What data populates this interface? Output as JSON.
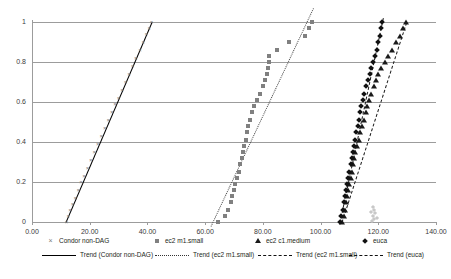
{
  "chart_data": {
    "type": "scatter",
    "title": "",
    "xlabel": "",
    "ylabel": "",
    "xlim": [
      0,
      140
    ],
    "ylim": [
      0,
      1
    ],
    "xticks": [
      "0.00",
      "20.00",
      "40.00",
      "60.00",
      "80.00",
      "100.00",
      "120.00",
      "140.00"
    ],
    "xtick_values": [
      0,
      20,
      40,
      60,
      80,
      100,
      120,
      140
    ],
    "yticks": [
      "0",
      "0.2",
      "0.4",
      "0.6",
      "0.8",
      "1"
    ],
    "ytick_values": [
      0,
      0.2,
      0.4,
      0.6,
      0.8,
      1
    ],
    "grid": "horizontal",
    "legend_position": "bottom",
    "series": [
      {
        "name": "Condor non-DAG",
        "marker": "x",
        "color": "#7a7a7a",
        "points": [
          [
            12.0,
            0.0
          ],
          [
            12.6,
            0.03
          ],
          [
            13.2,
            0.06
          ],
          [
            14.0,
            0.09
          ],
          [
            15.0,
            0.12
          ],
          [
            16.0,
            0.16
          ],
          [
            17.0,
            0.2
          ],
          [
            18.0,
            0.23
          ],
          [
            19.2,
            0.27
          ],
          [
            20.4,
            0.31
          ],
          [
            21.6,
            0.35
          ],
          [
            22.8,
            0.39
          ],
          [
            24.0,
            0.43
          ],
          [
            25.2,
            0.47
          ],
          [
            26.4,
            0.51
          ],
          [
            27.6,
            0.55
          ],
          [
            28.8,
            0.59
          ],
          [
            30.0,
            0.62
          ],
          [
            31.2,
            0.66
          ],
          [
            32.4,
            0.7
          ],
          [
            33.6,
            0.74
          ],
          [
            34.8,
            0.78
          ],
          [
            36.0,
            0.82
          ],
          [
            37.4,
            0.86
          ],
          [
            38.6,
            0.9
          ],
          [
            39.6,
            0.94
          ],
          [
            40.6,
            0.97
          ],
          [
            41.4,
            1.0
          ]
        ]
      },
      {
        "name": "ec2 m1.small",
        "marker": "square",
        "color": "#808080",
        "points": [
          [
            64.5,
            0.0
          ],
          [
            67.0,
            0.03
          ],
          [
            68.0,
            0.06
          ],
          [
            68.8,
            0.1
          ],
          [
            69.4,
            0.13
          ],
          [
            70.0,
            0.16
          ],
          [
            70.5,
            0.19
          ],
          [
            71.0,
            0.22
          ],
          [
            71.6,
            0.25
          ],
          [
            72.2,
            0.29
          ],
          [
            72.6,
            0.32
          ],
          [
            73.0,
            0.35
          ],
          [
            73.5,
            0.38
          ],
          [
            74.0,
            0.41
          ],
          [
            74.5,
            0.45
          ],
          [
            75.0,
            0.48
          ],
          [
            75.6,
            0.51
          ],
          [
            76.2,
            0.55
          ],
          [
            77.0,
            0.58
          ],
          [
            78.0,
            0.61
          ],
          [
            79.0,
            0.64
          ],
          [
            80.0,
            0.68
          ],
          [
            80.8,
            0.71
          ],
          [
            81.5,
            0.74
          ],
          [
            81.8,
            0.77
          ],
          [
            82.0,
            0.8
          ],
          [
            82.2,
            0.83
          ],
          [
            85.0,
            0.86
          ],
          [
            89.0,
            0.9
          ],
          [
            94.5,
            0.93
          ],
          [
            96.0,
            0.97
          ],
          [
            97.0,
            1.0
          ]
        ]
      },
      {
        "name": "ec2 c1.medium",
        "marker": "triangle",
        "color": "#1a1a1a",
        "points": [
          [
            107.5,
            0.0
          ],
          [
            108.0,
            0.03
          ],
          [
            108.4,
            0.06
          ],
          [
            108.8,
            0.1
          ],
          [
            109.2,
            0.13
          ],
          [
            109.6,
            0.16
          ],
          [
            110.0,
            0.19
          ],
          [
            110.4,
            0.22
          ],
          [
            110.8,
            0.25
          ],
          [
            111.2,
            0.29
          ],
          [
            111.6,
            0.32
          ],
          [
            112.0,
            0.35
          ],
          [
            112.6,
            0.38
          ],
          [
            113.2,
            0.41
          ],
          [
            113.8,
            0.45
          ],
          [
            114.4,
            0.48
          ],
          [
            115.0,
            0.51
          ],
          [
            115.6,
            0.55
          ],
          [
            116.2,
            0.58
          ],
          [
            116.8,
            0.61
          ],
          [
            117.6,
            0.64
          ],
          [
            118.4,
            0.68
          ],
          [
            119.2,
            0.71
          ],
          [
            120.0,
            0.74
          ],
          [
            121.0,
            0.77
          ],
          [
            122.2,
            0.8
          ],
          [
            123.4,
            0.83
          ],
          [
            124.6,
            0.86
          ],
          [
            126.0,
            0.9
          ],
          [
            127.4,
            0.93
          ],
          [
            128.6,
            0.97
          ],
          [
            129.6,
            1.0
          ]
        ]
      },
      {
        "name": "euca",
        "marker": "diamond",
        "color": "#111111",
        "points": [
          [
            106.8,
            0.0
          ],
          [
            107.2,
            0.03
          ],
          [
            107.6,
            0.06
          ],
          [
            108.0,
            0.1
          ],
          [
            108.4,
            0.13
          ],
          [
            108.8,
            0.16
          ],
          [
            109.2,
            0.19
          ],
          [
            109.6,
            0.22
          ],
          [
            110.0,
            0.25
          ],
          [
            110.4,
            0.29
          ],
          [
            110.8,
            0.32
          ],
          [
            111.2,
            0.35
          ],
          [
            111.6,
            0.38
          ],
          [
            112.0,
            0.41
          ],
          [
            112.4,
            0.45
          ],
          [
            112.8,
            0.48
          ],
          [
            113.2,
            0.51
          ],
          [
            113.6,
            0.55
          ],
          [
            114.0,
            0.58
          ],
          [
            114.6,
            0.61
          ],
          [
            115.2,
            0.64
          ],
          [
            115.8,
            0.68
          ],
          [
            116.4,
            0.71
          ],
          [
            117.0,
            0.74
          ],
          [
            117.6,
            0.77
          ],
          [
            118.2,
            0.8
          ],
          [
            118.8,
            0.83
          ],
          [
            119.4,
            0.86
          ],
          [
            120.0,
            0.9
          ],
          [
            120.6,
            0.93
          ],
          [
            121.0,
            0.97
          ],
          [
            121.4,
            1.0
          ]
        ],
        "outliers": [
          [
            117.8,
            0.005
          ],
          [
            118.4,
            0.015
          ],
          [
            118.0,
            0.03
          ],
          [
            119.0,
            0.045
          ],
          [
            118.6,
            0.06
          ],
          [
            117.4,
            0.05
          ],
          [
            119.4,
            0.02
          ],
          [
            118.2,
            0.075
          ]
        ]
      }
    ],
    "trends": [
      {
        "name": "Trend (Condor non-DAG)",
        "style": "solid",
        "x0": 11.8,
        "y0": 0.0,
        "x1": 41.6,
        "y1": 1.0
      },
      {
        "name": "Trend (ec2 m1.small)",
        "style": "dotted",
        "x0": 62.0,
        "y0": -0.02,
        "x1": 97.5,
        "y1": 1.07
      },
      {
        "name": "Trend (ec2 m1.small)",
        "style": "dashed",
        "x0": 107.4,
        "y0": 0.0,
        "x1": 129.8,
        "y1": 1.0
      },
      {
        "name": "Trend (euca)",
        "style": "dashdot",
        "x0": 106.6,
        "y0": 0.0,
        "x1": 121.6,
        "y1": 1.02
      }
    ],
    "legend_markers": [
      {
        "label": "Condor non-DAG",
        "marker": "x",
        "left": 46
      },
      {
        "label": "ec2 m1.small",
        "marker": "square",
        "left": 152
      },
      {
        "label": "ec2 c1.medium",
        "marker": "triangle",
        "left": 253
      },
      {
        "label": "euca",
        "marker": "diamond",
        "left": 360
      }
    ],
    "legend_trends": [
      {
        "label": "Trend (Condor non-DAG)",
        "style": "solid",
        "left": 42
      },
      {
        "label": "Trend (ec2 m1.small)",
        "style": "dotted",
        "left": 155
      },
      {
        "label": "Trend (ec2 m1.small)",
        "style": "dashed",
        "left": 258
      },
      {
        "label": "Trend (euca)",
        "style": "dashdot",
        "left": 349
      }
    ]
  }
}
